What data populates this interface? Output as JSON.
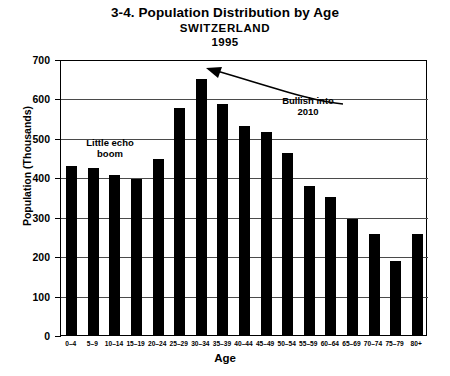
{
  "chart_data": {
    "type": "bar",
    "title": "3-4. Population Distribution by Age",
    "subtitle": "SWITZERLAND",
    "year": "1995",
    "xlabel": "Age",
    "ylabel": "Population (Thousands)",
    "ylim": [
      0,
      700
    ],
    "ytick_step": 100,
    "yticks": [
      "0",
      "100",
      "200",
      "300",
      "400",
      "500",
      "600",
      "700"
    ],
    "grid": true,
    "legend": "none",
    "bar_color": "#000000",
    "categories": [
      "0–4",
      "5–9",
      "10–14",
      "15–19",
      "20–24",
      "25–29",
      "30–34",
      "35–39",
      "40–44",
      "45–49",
      "50–54",
      "55–59",
      "60–64",
      "65–69",
      "70–74",
      "75–79",
      "80+"
    ],
    "values": [
      428,
      423,
      406,
      396,
      447,
      575,
      650,
      585,
      531,
      516,
      462,
      378,
      350,
      295,
      256,
      188,
      257
    ],
    "annotations": [
      {
        "id": "little-echo-boom",
        "text": "Little echo\nboom"
      },
      {
        "id": "bullish-into-2010",
        "text": "Bullish into\n2010"
      }
    ]
  }
}
